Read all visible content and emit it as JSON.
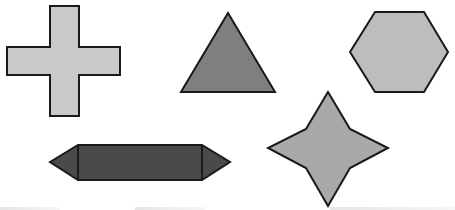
{
  "canvas": {
    "width": 455,
    "height": 210,
    "background": "#ffffff"
  },
  "shapes": [
    {
      "id": "cross",
      "label": "Cross",
      "fill": "#c9c9c9",
      "stroke": "#1a1a1a"
    },
    {
      "id": "triangle",
      "label": "Triangle",
      "fill": "#7f7f7f",
      "stroke": "#1a1a1a"
    },
    {
      "id": "hexagon",
      "label": "Hexagon",
      "fill": "#bdbdbd",
      "stroke": "#1a1a1a"
    },
    {
      "id": "elongated-hexagon",
      "label": "Elongated hexagon",
      "fill": "#4a4a4a",
      "stroke": "#1a1a1a"
    },
    {
      "id": "four-point-star",
      "label": "Four-pointed star",
      "fill": "#a9a9a9",
      "stroke": "#1a1a1a"
    }
  ]
}
